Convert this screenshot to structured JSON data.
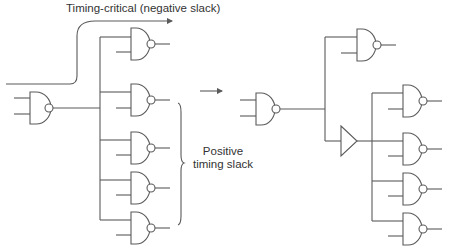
{
  "labels": {
    "timing_critical": "Timing-critical (negative slack)",
    "positive_line1": "Positive",
    "positive_line2": "timing slack"
  },
  "diagram": {
    "left": {
      "driver": "NAND gate",
      "loads": 5,
      "critical_path": "arrow from primary input routed to top load"
    },
    "transform_arrow": "right-arrow",
    "right": {
      "driver": "NAND gate",
      "direct_loads": 1,
      "buffer": "buffer-triangle",
      "buffered_loads": 4
    },
    "colors": {
      "stroke": "#5a5a5a",
      "text": "#333333",
      "background": "#ffffff"
    }
  }
}
